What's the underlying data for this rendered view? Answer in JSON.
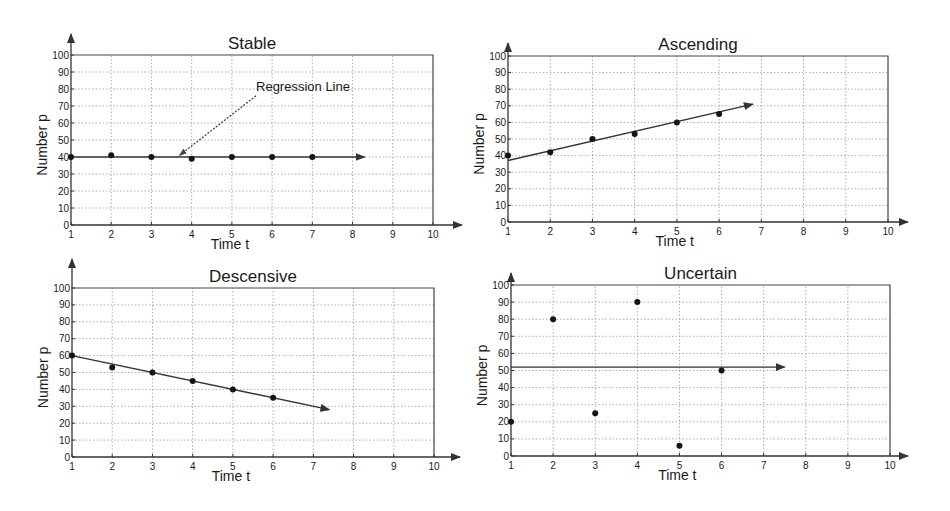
{
  "figure": {
    "background": "#ffffff",
    "ink_color": "#1a1a1a"
  },
  "chart_data": [
    {
      "type": "scatter",
      "title": "Stable",
      "xlabel": "Time t",
      "ylabel": "Number p",
      "xlim": [
        1,
        10
      ],
      "ylim": [
        0,
        100
      ],
      "xticks": [
        1,
        2,
        3,
        4,
        5,
        6,
        7,
        8,
        9,
        10
      ],
      "yticks": [
        0,
        10,
        20,
        30,
        40,
        50,
        60,
        70,
        80,
        90,
        100
      ],
      "grid": true,
      "points": {
        "x": [
          1,
          2,
          3,
          4,
          5,
          6,
          7
        ],
        "y": [
          40,
          41,
          40,
          39,
          40,
          40,
          40
        ]
      },
      "regression_line": {
        "from": [
          1,
          40
        ],
        "to": [
          8.3,
          40
        ],
        "arrow": true
      },
      "annotation": {
        "text": "Regression Line",
        "text_at": [
          5.6,
          81
        ],
        "arrow_from": [
          5.6,
          76
        ],
        "arrow_to": [
          3.7,
          41
        ]
      },
      "layout": {
        "x0": 71,
        "x1": 433,
        "y0": 225,
        "y1": 55,
        "yarrow": 34,
        "xarrow": 462
      }
    },
    {
      "type": "scatter",
      "title": "Ascending",
      "xlabel": "Time t",
      "ylabel": "Number p",
      "xlim": [
        1,
        10
      ],
      "ylim": [
        0,
        100
      ],
      "xticks": [
        1,
        2,
        3,
        4,
        5,
        6,
        7,
        8,
        9,
        10
      ],
      "yticks": [
        0,
        10,
        20,
        30,
        40,
        50,
        60,
        70,
        80,
        90,
        100
      ],
      "grid": true,
      "points": {
        "x": [
          1,
          2,
          3,
          4,
          5,
          6
        ],
        "y": [
          40,
          42,
          50,
          53,
          60,
          65
        ]
      },
      "regression_line": {
        "from": [
          1,
          37
        ],
        "to": [
          6.8,
          71
        ],
        "arrow": true
      },
      "layout": {
        "x0": 508,
        "x1": 888,
        "y0": 222,
        "y1": 56,
        "yarrow": 43,
        "xarrow": 908
      }
    },
    {
      "type": "scatter",
      "title": "Descensive",
      "xlabel": "Time t",
      "ylabel": "Number p",
      "xlim": [
        1,
        10
      ],
      "ylim": [
        0,
        100
      ],
      "xticks": [
        1,
        2,
        3,
        4,
        5,
        6,
        7,
        8,
        9,
        10
      ],
      "yticks": [
        0,
        10,
        20,
        30,
        40,
        50,
        60,
        70,
        80,
        90,
        100
      ],
      "grid": true,
      "points": {
        "x": [
          1,
          2,
          3,
          4,
          5,
          6
        ],
        "y": [
          60,
          53,
          50,
          45,
          40,
          35
        ]
      },
      "regression_line": {
        "from": [
          1,
          60
        ],
        "to": [
          7.4,
          28
        ],
        "arrow": true
      },
      "layout": {
        "x0": 72,
        "x1": 434,
        "y0": 457,
        "y1": 288,
        "yarrow": 259,
        "xarrow": 460
      }
    },
    {
      "type": "scatter",
      "title": "Uncertain",
      "xlabel": "Time t",
      "ylabel": "Number p",
      "xlim": [
        1,
        10
      ],
      "ylim": [
        0,
        100
      ],
      "xticks": [
        1,
        2,
        3,
        4,
        5,
        6,
        7,
        8,
        9,
        10
      ],
      "yticks": [
        0,
        10,
        20,
        30,
        40,
        50,
        60,
        70,
        80,
        90,
        100
      ],
      "grid": true,
      "points": {
        "x": [
          1,
          2,
          3,
          4,
          5,
          6
        ],
        "y": [
          20,
          80,
          25,
          90,
          6,
          50
        ]
      },
      "regression_line": {
        "from": [
          1,
          52
        ],
        "to": [
          7.5,
          52
        ],
        "arrow": true
      },
      "layout": {
        "x0": 511,
        "x1": 890,
        "y0": 456,
        "y1": 285,
        "yarrow": 273,
        "xarrow": 908
      }
    }
  ]
}
